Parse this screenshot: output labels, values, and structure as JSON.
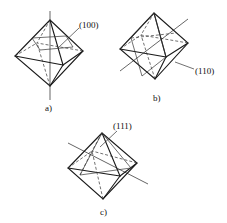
{
  "figure": {
    "panels": [
      {
        "id": "a",
        "caption": "a)",
        "plane_label": "(100)",
        "description": "Octahedron with (100) plane section; axis vertical"
      },
      {
        "id": "b",
        "caption": "b)",
        "plane_label": "(110)",
        "description": "Octahedron with (110) plane section; axis diagonal"
      },
      {
        "id": "c",
        "caption": "c)",
        "plane_label": "(111)",
        "description": "Octahedron with (111) plane section; axis diagonal"
      }
    ]
  }
}
